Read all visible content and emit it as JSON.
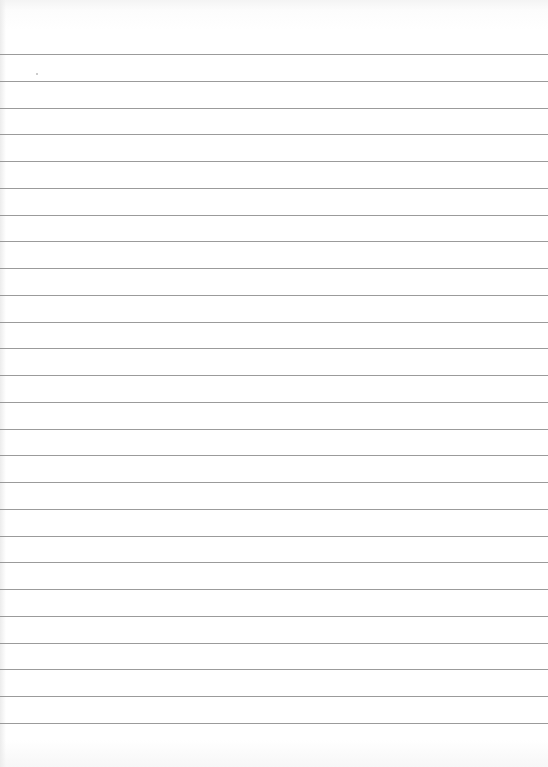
{
  "page": {
    "type": "ruled-paper",
    "background_color": "#ffffff",
    "rule_color": "#8a8a8a",
    "rule_count": 26,
    "first_rule_y": 54,
    "rule_spacing": 26.76
  }
}
